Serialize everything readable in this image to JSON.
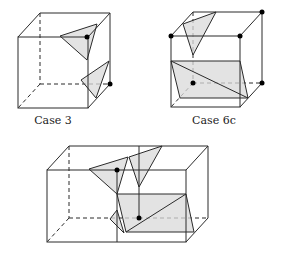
{
  "figures": [
    {
      "id": "case3",
      "label": "Case 3",
      "shape": "cube",
      "marked_vertices": 2,
      "triangles": 2
    },
    {
      "id": "case6c",
      "label": "Case 6c",
      "shape": "cube",
      "marked_vertices": 5,
      "triangles": 1,
      "quads": 1
    },
    {
      "id": "combined",
      "label": "",
      "shape": "two adjacent cubes",
      "marked_vertices": 2
    }
  ],
  "colors": {
    "edge": "#2a2a2a",
    "fill": "#d9d9d9",
    "vertex": "#000000"
  }
}
